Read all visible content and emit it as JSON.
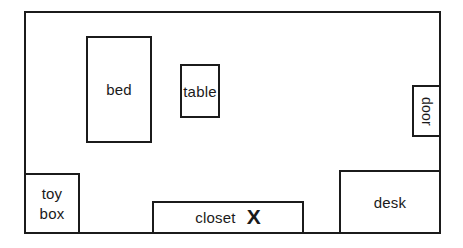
{
  "page": {
    "background_color": "#ffffff",
    "line_color": "#1b1b1b",
    "text_color": "#1a1a1a"
  },
  "floor_plan": {
    "items": {
      "bed": {
        "label": "bed"
      },
      "table": {
        "label": "table"
      },
      "door": {
        "label": "door"
      },
      "toy_box": {
        "line1": "toy",
        "line2": "box"
      },
      "closet": {
        "label": "closet",
        "marker": "X"
      },
      "desk": {
        "label": "desk"
      }
    }
  }
}
